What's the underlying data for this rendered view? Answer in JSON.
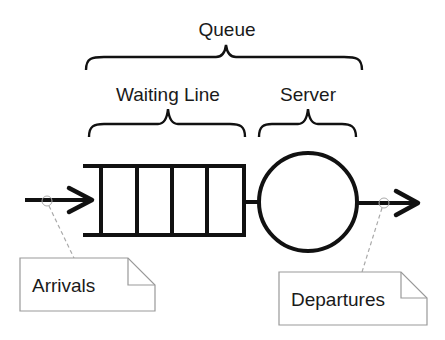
{
  "diagram": {
    "title": "Queue",
    "labels": {
      "queue": "Queue",
      "waiting_line": "Waiting Line",
      "server": "Server"
    },
    "notes": {
      "arrivals": "Arrivals",
      "departures": "Departures"
    },
    "queue_slots": 4,
    "colors": {
      "stroke": "#111111",
      "note_border": "#999999",
      "connector": "#aaaaaa",
      "background": "#ffffff"
    }
  }
}
